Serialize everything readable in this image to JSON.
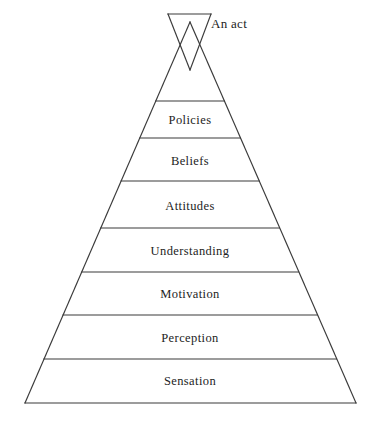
{
  "diagram": {
    "background_color": "#ffffff",
    "line_color": "#3a3a3a",
    "text_color": "#232323",
    "apex": {
      "label": "An act",
      "shape": "inverted-triangle"
    },
    "tiers": [
      {
        "label": "Policies"
      },
      {
        "label": "Beliefs"
      },
      {
        "label": "Attitudes"
      },
      {
        "label": "Understanding"
      },
      {
        "label": "Motivation"
      },
      {
        "label": "Perception"
      },
      {
        "label": "Sensation"
      }
    ]
  },
  "geometry": {
    "apex_triangle": {
      "top_left_x": 168,
      "top_right_x": 211,
      "top_y": 14,
      "bottom_x": 190,
      "bottom_y": 70
    },
    "pyramid": {
      "apex_x": 190,
      "apex_y": 22,
      "base_left_x": 25,
      "base_right_x": 356,
      "base_y": 403
    },
    "divider_y": [
      101,
      138,
      181,
      228,
      272,
      315,
      359
    ]
  }
}
